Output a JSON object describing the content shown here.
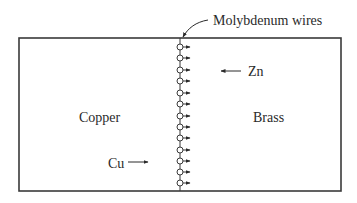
{
  "diagram": {
    "type": "kirkendall-diffusion-couple",
    "labels": {
      "markers": "Molybdenum wires",
      "left_region": "Copper",
      "right_region": "Brass",
      "zn_flux": "Zn",
      "cu_flux": "Cu"
    },
    "colors": {
      "stroke": "#3a3a3a",
      "text": "#2a2a2a",
      "background": "#ffffff"
    },
    "box": {
      "x": 19,
      "y": 38,
      "width": 322,
      "height": 153
    },
    "interface_x": 180,
    "wire_count": 13,
    "wire_y_positions": [
      47,
      58,
      70,
      81,
      93,
      104,
      116,
      127,
      138,
      150,
      161,
      172,
      183
    ],
    "flux_arrows": [
      {
        "species": "Zn",
        "direction": "left",
        "from_x": 241,
        "to_x": 220,
        "y": 71
      },
      {
        "species": "Cu",
        "direction": "right",
        "from_x": 128,
        "to_x": 148,
        "y": 162
      }
    ]
  }
}
